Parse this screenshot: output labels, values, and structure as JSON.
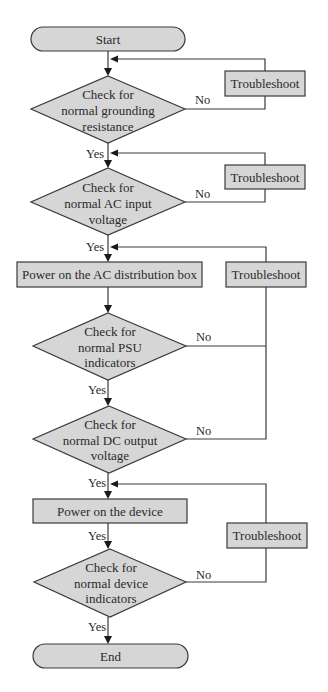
{
  "diagram": {
    "type": "flowchart",
    "colors": {
      "fill": "#d6d6d6",
      "stroke": "#3a3a3a",
      "text": "#2a2a2a",
      "background": "#ffffff"
    },
    "nodes": {
      "start": {
        "label": "Start"
      },
      "check_grounding": {
        "lines": [
          "Check for",
          "normal grounding",
          "resistance"
        ]
      },
      "check_ac_input": {
        "lines": [
          "Check for",
          "normal AC input",
          "voltage"
        ]
      },
      "power_ac_box": {
        "label": "Power on the AC distribution box"
      },
      "check_psu": {
        "lines": [
          "Check for",
          "normal PSU",
          "indicators"
        ]
      },
      "check_dc_output": {
        "lines": [
          "Check for",
          "normal DC output",
          "voltage"
        ]
      },
      "power_device": {
        "label": "Power on the device"
      },
      "check_device_ind": {
        "lines": [
          "Check for",
          "normal device",
          "indicators"
        ]
      },
      "end": {
        "label": "End"
      },
      "troubleshoot_1": {
        "label": "Troubleshoot"
      },
      "troubleshoot_2": {
        "label": "Troubleshoot"
      },
      "troubleshoot_3": {
        "label": "Troubleshoot"
      },
      "troubleshoot_4": {
        "label": "Troubleshoot"
      }
    },
    "edge_labels": {
      "yes": "Yes",
      "no": "No"
    }
  }
}
